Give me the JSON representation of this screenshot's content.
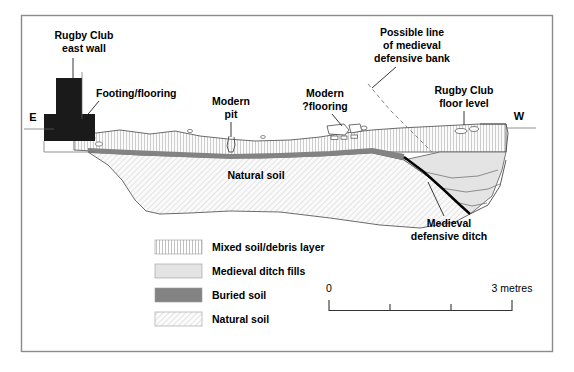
{
  "figure": {
    "type": "archaeological-section-drawing",
    "compass": {
      "left_label": "E",
      "right_label": "W"
    },
    "annotations": [
      {
        "id": "rugby-club-east-wall",
        "label_line1": "Rugby Club",
        "label_line2": "east wall"
      },
      {
        "id": "footing-flooring",
        "label_line1": "Footing/flooring",
        "label_line2": ""
      },
      {
        "id": "modern-pit",
        "label_line1": "Modern",
        "label_line2": "pit"
      },
      {
        "id": "modern-flooring",
        "label_line1": "Modern",
        "label_line2": "?flooring"
      },
      {
        "id": "possible-bank",
        "label_line1": "Possible line",
        "label_line2": "of medieval",
        "label_line3": "defensive bank"
      },
      {
        "id": "rugby-club-floor-level",
        "label_line1": "Rugby Club",
        "label_line2": "floor level"
      },
      {
        "id": "natural-soil-inline",
        "label_line1": "Natural soil",
        "label_line2": ""
      },
      {
        "id": "medieval-defensive-ditch",
        "label_line1": "Medieval",
        "label_line2": "defensive ditch"
      }
    ],
    "legend": {
      "items": [
        {
          "label": "Mixed soil/debris layer",
          "pattern": "vertical-hatch",
          "color": "#f2f2f2"
        },
        {
          "label": "Medieval ditch fills",
          "pattern": "solid-light",
          "color": "#e2e2e2"
        },
        {
          "label": "Buried soil",
          "pattern": "solid-mid",
          "color": "#838383"
        },
        {
          "label": "Natural soil",
          "pattern": "diagonal-hatch",
          "color": "#f0f0f0"
        }
      ]
    },
    "scale": {
      "start_label": "0",
      "end_label": "3 metres",
      "ticks": [
        0,
        1,
        2,
        3
      ],
      "units": "metres"
    },
    "colors": {
      "frame": "#8a8a8a",
      "wall": "#1a1a1a",
      "buried_soil": "#838383",
      "ditch_cut": "#000000",
      "outline": "#4a4a4a",
      "background": "#ffffff"
    }
  }
}
